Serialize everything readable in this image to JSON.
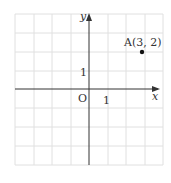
{
  "diagram": {
    "type": "coordinate-plane",
    "axes": {
      "x_label": "x",
      "y_label": "y",
      "origin_label": "O"
    },
    "ticks": {
      "x_unit_label": "1",
      "y_unit_label": "1"
    },
    "grid": {
      "x_range": [
        -4,
        4
      ],
      "y_range": [
        -4,
        4
      ]
    },
    "points": [
      {
        "name": "A",
        "label": "A(3, 2)",
        "x": 3,
        "y": 2
      }
    ],
    "colors": {
      "grid": "#e0e0e0",
      "axis": "#333333",
      "point": "#111111"
    }
  }
}
